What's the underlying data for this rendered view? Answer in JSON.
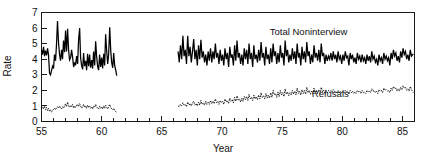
{
  "chart_data": {
    "type": "line",
    "title": "",
    "subtitle": "",
    "xlabel": "Year",
    "ylabel": "Rate",
    "xlim": [
      55,
      86
    ],
    "ylim": [
      0,
      7
    ],
    "grid": false,
    "legend_position": "inline-annotation",
    "x_ticks_major": [
      55,
      60,
      65,
      70,
      75,
      80,
      85
    ],
    "x_tick_labels": [
      "55",
      "60",
      "65",
      "70",
      "75",
      "80",
      "85"
    ],
    "x_ticks_minor_step": 1,
    "y_ticks": [
      0,
      1,
      2,
      3,
      4,
      5,
      6,
      7
    ],
    "y_tick_labels": [
      "0",
      "1",
      "2",
      "3",
      "4",
      "5",
      "6",
      "7"
    ],
    "annotations": [
      {
        "text": "Total Noninterview",
        "x": 77.2,
        "y": 5.55
      },
      {
        "text": "Refusals",
        "x": 79.0,
        "y": 1.55
      }
    ],
    "data_gap": {
      "from": 61.25,
      "to": 66.35,
      "note": "no data plotted between these years"
    },
    "series": [
      {
        "name": "Total Noninterview",
        "style": "solid",
        "x": [
          55.0,
          55.08,
          55.17,
          55.25,
          55.33,
          55.42,
          55.5,
          55.58,
          55.67,
          55.75,
          55.83,
          55.92,
          56.0,
          56.08,
          56.17,
          56.25,
          56.33,
          56.42,
          56.5,
          56.58,
          56.67,
          56.75,
          56.83,
          56.92,
          57.0,
          57.08,
          57.17,
          57.25,
          57.33,
          57.42,
          57.5,
          57.58,
          57.67,
          57.75,
          57.83,
          57.92,
          58.0,
          58.08,
          58.17,
          58.25,
          58.33,
          58.42,
          58.5,
          58.58,
          58.67,
          58.75,
          58.83,
          58.92,
          59.0,
          59.08,
          59.17,
          59.25,
          59.33,
          59.42,
          59.5,
          59.58,
          59.67,
          59.75,
          59.83,
          59.92,
          60.0,
          60.08,
          60.17,
          60.25,
          60.33,
          60.42,
          60.5,
          60.58,
          60.67,
          60.75,
          60.83,
          60.92,
          61.0,
          61.08,
          61.17,
          61.25
        ],
        "y": [
          4.6,
          4.3,
          4.8,
          4.2,
          4.55,
          4.25,
          4.7,
          4.3,
          3.1,
          3.0,
          3.25,
          3.55,
          3.4,
          4.3,
          3.9,
          5.0,
          6.45,
          5.0,
          4.3,
          3.9,
          4.6,
          4.0,
          5.2,
          4.45,
          5.85,
          4.5,
          5.95,
          4.6,
          3.95,
          4.1,
          4.6,
          4.15,
          3.5,
          3.8,
          3.6,
          4.2,
          3.7,
          5.2,
          6.0,
          4.1,
          3.6,
          3.35,
          4.4,
          3.55,
          3.9,
          3.3,
          4.35,
          3.55,
          4.3,
          3.45,
          3.95,
          3.4,
          4.5,
          3.6,
          5.15,
          4.2,
          3.5,
          3.3,
          4.3,
          3.5,
          4.1,
          3.4,
          4.35,
          3.6,
          5.6,
          4.5,
          3.7,
          4.3,
          6.05,
          4.6,
          3.8,
          3.45,
          4.4,
          3.6,
          3.3,
          2.95
        ]
      },
      {
        "name": "Total Noninterview (cont.)",
        "style": "solid",
        "x": [
          66.35,
          66.45,
          66.55,
          66.65,
          66.75,
          66.85,
          66.95,
          67.05,
          67.15,
          67.25,
          67.35,
          67.45,
          67.55,
          67.65,
          67.75,
          67.85,
          67.95,
          68.05,
          68.15,
          68.25,
          68.35,
          68.45,
          68.55,
          68.65,
          68.75,
          68.85,
          68.95,
          69.05,
          69.15,
          69.25,
          69.35,
          69.45,
          69.55,
          69.65,
          69.75,
          69.85,
          69.95,
          70.05,
          70.15,
          70.25,
          70.35,
          70.45,
          70.55,
          70.65,
          70.75,
          70.85,
          70.95,
          71.05,
          71.15,
          71.25,
          71.35,
          71.45,
          71.55,
          71.65,
          71.75,
          71.85,
          71.95,
          72.05,
          72.15,
          72.25,
          72.35,
          72.45,
          72.55,
          72.65,
          72.75,
          72.85,
          72.95,
          73.05,
          73.15,
          73.25,
          73.35,
          73.45,
          73.55,
          73.65,
          73.75,
          73.85,
          73.95,
          74.05,
          74.15,
          74.25,
          74.35,
          74.45,
          74.55,
          74.65,
          74.75,
          74.85,
          74.95,
          75.05,
          75.15,
          75.25,
          75.35,
          75.45,
          75.55,
          75.65,
          75.75,
          75.85,
          75.95,
          76.05,
          76.15,
          76.25,
          76.35,
          76.45,
          76.55,
          76.65,
          76.75,
          76.85,
          76.95,
          77.05,
          77.15,
          77.25,
          77.35,
          77.45,
          77.55,
          77.65,
          77.75,
          77.85,
          77.95,
          78.05,
          78.15,
          78.25,
          78.35,
          78.45,
          78.55,
          78.65,
          78.75,
          78.85,
          78.95,
          79.05,
          79.15,
          79.25,
          79.35,
          79.45,
          79.55,
          79.65,
          79.75,
          79.85,
          79.95,
          80.05,
          80.15,
          80.25,
          80.35,
          80.45,
          80.55,
          80.65,
          80.75,
          80.85,
          80.95,
          81.05,
          81.15,
          81.25,
          81.35,
          81.45,
          81.55,
          81.65,
          81.75,
          81.85,
          81.95,
          82.05,
          82.15,
          82.25,
          82.35,
          82.45,
          82.55,
          82.65,
          82.75,
          82.85,
          82.95,
          83.05,
          83.15,
          83.25,
          83.35,
          83.45,
          83.55,
          83.65,
          83.75,
          83.85,
          83.95,
          84.05,
          84.15,
          84.25,
          84.35,
          84.45,
          84.55,
          84.65,
          84.75,
          84.85,
          84.95,
          85.05,
          85.15,
          85.25,
          85.35,
          85.45,
          85.55,
          85.65,
          85.75,
          85.9
        ],
        "y": [
          4.5,
          3.8,
          4.9,
          4.0,
          5.5,
          4.2,
          4.6,
          3.7,
          5.5,
          4.2,
          4.8,
          3.8,
          4.5,
          5.3,
          4.0,
          4.6,
          3.6,
          4.9,
          4.0,
          5.25,
          4.1,
          4.5,
          3.8,
          4.3,
          3.6,
          4.5,
          3.9,
          4.7,
          3.8,
          4.5,
          4.0,
          5.0,
          4.1,
          4.4,
          3.7,
          4.6,
          3.9,
          4.3,
          3.6,
          4.7,
          4.0,
          4.4,
          3.5,
          4.8,
          4.1,
          4.3,
          3.6,
          4.9,
          3.9,
          5.2,
          4.1,
          4.4,
          3.7,
          4.3,
          3.6,
          4.7,
          4.0,
          4.6,
          3.7,
          5.0,
          4.0,
          4.4,
          3.5,
          4.9,
          4.0,
          4.3,
          3.8,
          4.6,
          3.9,
          5.1,
          4.1,
          4.4,
          3.6,
          4.8,
          4.0,
          4.3,
          3.7,
          4.7,
          3.8,
          5.0,
          4.2,
          4.5,
          3.7,
          4.4,
          3.8,
          4.9,
          4.1,
          4.4,
          3.6,
          5.2,
          4.2,
          4.6,
          3.8,
          4.3,
          3.9,
          4.7,
          4.0,
          4.5,
          3.7,
          5.0,
          4.1,
          4.4,
          3.6,
          4.8,
          4.0,
          4.5,
          3.8,
          5.1,
          4.2,
          4.5,
          3.7,
          4.3,
          3.8,
          4.9,
          4.1,
          4.4,
          3.9,
          4.6,
          3.8,
          5.0,
          4.2,
          4.4,
          3.7,
          4.3,
          3.9,
          4.2,
          4.0,
          4.4,
          3.9,
          4.5,
          4.0,
          4.3,
          3.8,
          4.5,
          4.0,
          4.2,
          3.7,
          4.3,
          3.9,
          4.5,
          4.1,
          4.2,
          3.6,
          4.4,
          4.0,
          4.3,
          3.8,
          4.1,
          3.7,
          4.4,
          4.0,
          4.2,
          3.8,
          4.3,
          3.9,
          4.1,
          3.7,
          4.3,
          3.9,
          4.2,
          3.8,
          4.5,
          4.0,
          4.2,
          3.8,
          4.0,
          3.6,
          4.3,
          3.9,
          4.1,
          3.7,
          4.4,
          4.0,
          4.2,
          3.9,
          4.1,
          3.6,
          4.4,
          4.0,
          4.6,
          4.2,
          4.4,
          3.9,
          4.2,
          3.8,
          4.5,
          4.1,
          4.7,
          4.3,
          4.5,
          4.0,
          4.3,
          3.9,
          4.6,
          4.2,
          4.35
        ]
      },
      {
        "name": "Refusals",
        "style": "dotted",
        "x": [
          55.0,
          55.08,
          55.17,
          55.25,
          55.33,
          55.42,
          55.5,
          55.58,
          55.67,
          55.75,
          55.83,
          55.92,
          56.0,
          56.08,
          56.17,
          56.25,
          56.33,
          56.42,
          56.5,
          56.58,
          56.67,
          56.75,
          56.83,
          56.92,
          57.0,
          57.08,
          57.17,
          57.25,
          57.33,
          57.42,
          57.5,
          57.58,
          57.67,
          57.75,
          57.83,
          57.92,
          58.0,
          58.08,
          58.17,
          58.25,
          58.33,
          58.42,
          58.5,
          58.58,
          58.67,
          58.75,
          58.83,
          58.92,
          59.0,
          59.08,
          59.17,
          59.25,
          59.33,
          59.42,
          59.5,
          59.58,
          59.67,
          59.75,
          59.83,
          59.92,
          60.0,
          60.08,
          60.17,
          60.25,
          60.33,
          60.42,
          60.5,
          60.58,
          60.67,
          60.75,
          60.83,
          60.92,
          61.0,
          61.08,
          61.17,
          61.25
        ],
        "y": [
          0.85,
          0.95,
          0.8,
          1.0,
          0.75,
          0.9,
          0.7,
          0.85,
          0.65,
          0.75,
          0.6,
          0.7,
          0.8,
          0.85,
          0.75,
          0.9,
          0.95,
          0.85,
          1.0,
          0.9,
          0.8,
          0.95,
          0.85,
          1.0,
          1.15,
          0.95,
          1.25,
          1.0,
          0.9,
          1.05,
          0.95,
          1.1,
          0.85,
          1.0,
          0.9,
          1.05,
          1.1,
          0.95,
          1.15,
          1.0,
          0.85,
          0.95,
          1.1,
          0.9,
          1.0,
          0.85,
          1.05,
          0.9,
          1.0,
          0.85,
          0.95,
          0.8,
          1.0,
          0.9,
          1.1,
          0.95,
          0.85,
          0.8,
          1.0,
          0.85,
          0.95,
          0.8,
          1.0,
          0.85,
          1.05,
          0.9,
          0.8,
          0.95,
          1.1,
          0.9,
          0.8,
          0.75,
          0.85,
          0.7,
          0.65,
          0.55
        ]
      },
      {
        "name": "Refusals (cont.)",
        "style": "dotted",
        "x": [
          66.35,
          66.45,
          66.55,
          66.65,
          66.75,
          66.85,
          66.95,
          67.05,
          67.15,
          67.25,
          67.35,
          67.45,
          67.55,
          67.65,
          67.75,
          67.85,
          67.95,
          68.05,
          68.15,
          68.25,
          68.35,
          68.45,
          68.55,
          68.65,
          68.75,
          68.85,
          68.95,
          69.05,
          69.15,
          69.25,
          69.35,
          69.45,
          69.55,
          69.65,
          69.75,
          69.85,
          69.95,
          70.05,
          70.15,
          70.25,
          70.35,
          70.45,
          70.55,
          70.65,
          70.75,
          70.85,
          70.95,
          71.05,
          71.15,
          71.25,
          71.35,
          71.45,
          71.55,
          71.65,
          71.75,
          71.85,
          71.95,
          72.05,
          72.15,
          72.25,
          72.35,
          72.45,
          72.55,
          72.65,
          72.75,
          72.85,
          72.95,
          73.05,
          73.15,
          73.25,
          73.35,
          73.45,
          73.55,
          73.65,
          73.75,
          73.85,
          73.95,
          74.05,
          74.15,
          74.25,
          74.35,
          74.45,
          74.55,
          74.65,
          74.75,
          74.85,
          74.95,
          75.05,
          75.15,
          75.25,
          75.35,
          75.45,
          75.55,
          75.65,
          75.75,
          75.85,
          75.95,
          76.05,
          76.15,
          76.25,
          76.35,
          76.45,
          76.55,
          76.65,
          76.75,
          76.85,
          76.95,
          77.05,
          77.15,
          77.25,
          77.35,
          77.45,
          77.55,
          77.65,
          77.75,
          77.85,
          77.95,
          78.05,
          78.15,
          78.25,
          78.35,
          78.45,
          78.55,
          78.65,
          78.75,
          78.85,
          78.95,
          79.05,
          79.15,
          79.25,
          79.35,
          79.45,
          79.55,
          79.65,
          79.75,
          79.85,
          79.95,
          80.05,
          80.15,
          80.25,
          80.35,
          80.45,
          80.55,
          80.65,
          80.75,
          80.85,
          80.95,
          81.05,
          81.15,
          81.25,
          81.35,
          81.45,
          81.55,
          81.65,
          81.75,
          81.85,
          81.95,
          82.05,
          82.15,
          82.25,
          82.35,
          82.45,
          82.55,
          82.65,
          82.75,
          82.85,
          82.95,
          83.05,
          83.15,
          83.25,
          83.35,
          83.45,
          83.55,
          83.65,
          83.75,
          83.85,
          83.95,
          84.05,
          84.15,
          84.25,
          84.35,
          84.45,
          84.55,
          84.65,
          84.75,
          84.85,
          84.95,
          85.05,
          85.15,
          85.25,
          85.35,
          85.45,
          85.55,
          85.65,
          85.75,
          85.9
        ],
        "y": [
          1.0,
          0.95,
          1.1,
          1.0,
          1.2,
          1.05,
          1.1,
          0.95,
          1.25,
          1.05,
          1.15,
          1.0,
          1.2,
          1.3,
          1.05,
          1.15,
          1.0,
          1.25,
          1.05,
          1.35,
          1.1,
          1.2,
          1.05,
          1.3,
          1.1,
          1.25,
          1.1,
          1.35,
          1.15,
          1.3,
          1.15,
          1.45,
          1.2,
          1.3,
          1.1,
          1.35,
          1.2,
          1.3,
          1.1,
          1.45,
          1.25,
          1.35,
          1.15,
          1.5,
          1.3,
          1.4,
          1.2,
          1.55,
          1.3,
          1.65,
          1.35,
          1.45,
          1.25,
          1.5,
          1.3,
          1.6,
          1.4,
          1.6,
          1.35,
          1.75,
          1.45,
          1.55,
          1.35,
          1.7,
          1.45,
          1.6,
          1.4,
          1.7,
          1.45,
          1.85,
          1.55,
          1.65,
          1.45,
          1.8,
          1.5,
          1.7,
          1.5,
          1.85,
          1.55,
          2.0,
          1.7,
          1.8,
          1.55,
          1.9,
          1.6,
          2.0,
          1.7,
          1.85,
          1.6,
          2.1,
          1.75,
          1.9,
          1.65,
          1.85,
          1.7,
          2.0,
          1.75,
          1.95,
          1.7,
          2.15,
          1.8,
          1.95,
          1.7,
          2.05,
          1.8,
          2.0,
          1.75,
          2.2,
          1.85,
          2.0,
          1.75,
          1.95,
          1.8,
          2.15,
          1.85,
          2.0,
          1.8,
          2.05,
          1.8,
          2.2,
          1.9,
          2.0,
          1.8,
          1.95,
          1.85,
          2.0,
          1.85,
          2.0,
          1.85,
          2.05,
          1.9,
          1.95,
          1.8,
          2.0,
          1.85,
          1.95,
          1.8,
          1.95,
          1.85,
          2.0,
          1.9,
          1.95,
          1.75,
          2.0,
          1.85,
          1.95,
          1.8,
          1.9,
          1.8,
          2.0,
          1.9,
          1.95,
          1.8,
          2.0,
          1.85,
          1.9,
          1.8,
          2.0,
          1.9,
          1.95,
          1.85,
          2.1,
          1.95,
          2.0,
          1.85,
          1.95,
          1.8,
          2.05,
          1.95,
          2.0,
          1.85,
          2.15,
          2.0,
          2.05,
          1.95,
          2.0,
          1.85,
          2.15,
          2.0,
          2.25,
          2.1,
          2.15,
          1.95,
          2.1,
          1.95,
          2.2,
          2.05,
          2.3,
          2.15,
          2.2,
          2.0,
          2.1,
          1.95,
          2.25,
          2.05,
          1.85
        ]
      }
    ]
  }
}
